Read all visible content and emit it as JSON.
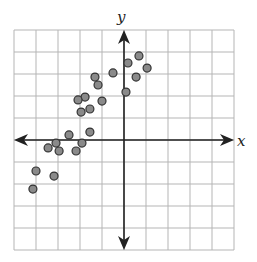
{
  "chart_data": {
    "type": "scatter",
    "title": "",
    "xlabel": "x",
    "ylabel": "y",
    "xlim": [
      -5,
      5
    ],
    "ylim": [
      -5,
      5
    ],
    "grid": true,
    "grid_step": 1,
    "tick_labels": false,
    "axes_arrows": true,
    "legend": null,
    "marker": {
      "fill": "#8a8a8a",
      "stroke": "#333333",
      "radius": 4
    },
    "points": [
      {
        "x": 0.68,
        "y": 3.82
      },
      {
        "x": 0.18,
        "y": 3.5
      },
      {
        "x": 1.05,
        "y": 3.27
      },
      {
        "x": -0.5,
        "y": 3.05
      },
      {
        "x": 0.55,
        "y": 2.86
      },
      {
        "x": 0.09,
        "y": 2.18
      },
      {
        "x": -1.32,
        "y": 2.86
      },
      {
        "x": -1.18,
        "y": 2.5
      },
      {
        "x": -1.77,
        "y": 1.95
      },
      {
        "x": -2.09,
        "y": 1.82
      },
      {
        "x": -1.0,
        "y": 1.77
      },
      {
        "x": -1.55,
        "y": 1.41
      },
      {
        "x": -1.95,
        "y": 1.27
      },
      {
        "x": -1.55,
        "y": 0.36
      },
      {
        "x": -2.5,
        "y": 0.23
      },
      {
        "x": -3.09,
        "y": -0.14
      },
      {
        "x": -3.45,
        "y": -0.36
      },
      {
        "x": -2.95,
        "y": -0.5
      },
      {
        "x": -1.91,
        "y": -0.14
      },
      {
        "x": -2.18,
        "y": -0.5
      },
      {
        "x": -4.0,
        "y": -1.41
      },
      {
        "x": -3.18,
        "y": -1.64
      },
      {
        "x": -4.14,
        "y": -2.23
      }
    ]
  },
  "labels": {
    "x_axis": "x",
    "y_axis": "y"
  },
  "colors": {
    "grid": "#b5b5b5",
    "axis": "#222222",
    "point_fill": "#8a8a8a",
    "point_stroke": "#333333"
  }
}
